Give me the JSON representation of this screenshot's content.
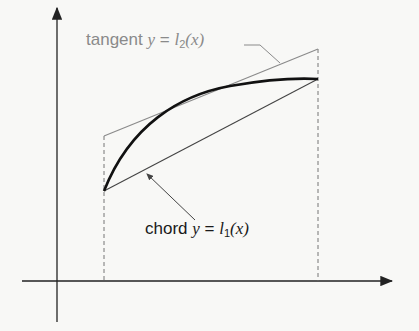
{
  "diagram": {
    "labels": {
      "tangent": {
        "word": "tangent",
        "var": "y",
        "eq": " = ",
        "fn": "l",
        "sub": "2",
        "arg": "(x)"
      },
      "chord": {
        "word": "chord",
        "var": "y",
        "eq": " = ",
        "fn": "l",
        "sub": "1",
        "arg": "(x)"
      }
    },
    "colors": {
      "background": "#f8f8f6",
      "axes": "#222222",
      "curve": "#111111",
      "tangent": "#8a8a8a",
      "chord": "#444444",
      "dashed": "#666666"
    },
    "geometry": {
      "x_axis": {
        "x1": 22,
        "x2": 392,
        "y": 281
      },
      "y_axis": {
        "x": 57,
        "y1": 8,
        "y2": 322
      },
      "left_bound_x": 104,
      "right_bound_x": 318,
      "curve_start": [
        104,
        191
      ],
      "curve_end": [
        318,
        79
      ],
      "tangent_start": [
        104,
        136
      ],
      "tangent_end": [
        318,
        49
      ],
      "chord_start": [
        104,
        191
      ],
      "chord_end": [
        318,
        79
      ]
    }
  }
}
